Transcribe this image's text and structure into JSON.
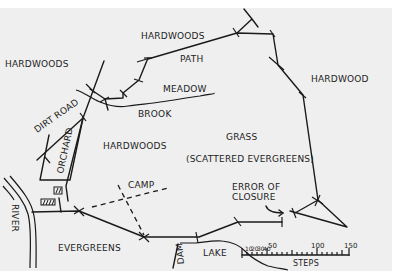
{
  "map": {
    "labels": {
      "hardwoods_nw": "HARDWOODS",
      "hardwoods_n": "HARDWOODS",
      "path": "PATH",
      "meadow": "MEADOW",
      "brook": "BROOK",
      "hardwood_e": "HARDWOOD",
      "dirt_road": "DIRT ROAD",
      "orchard": "ORCHARD",
      "hardwoods_center": "HARDWOODS",
      "grass": "GRASS",
      "scattered": "(SCATTERED EVERGREENS)",
      "river": "RIVER",
      "camp": "CAMP",
      "error_line1": "ERROR OF",
      "error_line2": "CLOSURE",
      "evergreens": "EVERGREENS",
      "dam": "DAM",
      "lake": "LAKE"
    },
    "scale": {
      "title": "STEPS",
      "ticks": [
        "10",
        "20",
        "30",
        "40",
        "50",
        "100",
        "150"
      ]
    },
    "colors": {
      "background": "#efefef",
      "ink": "#1a1a1a",
      "margin": "#ffffff"
    }
  }
}
